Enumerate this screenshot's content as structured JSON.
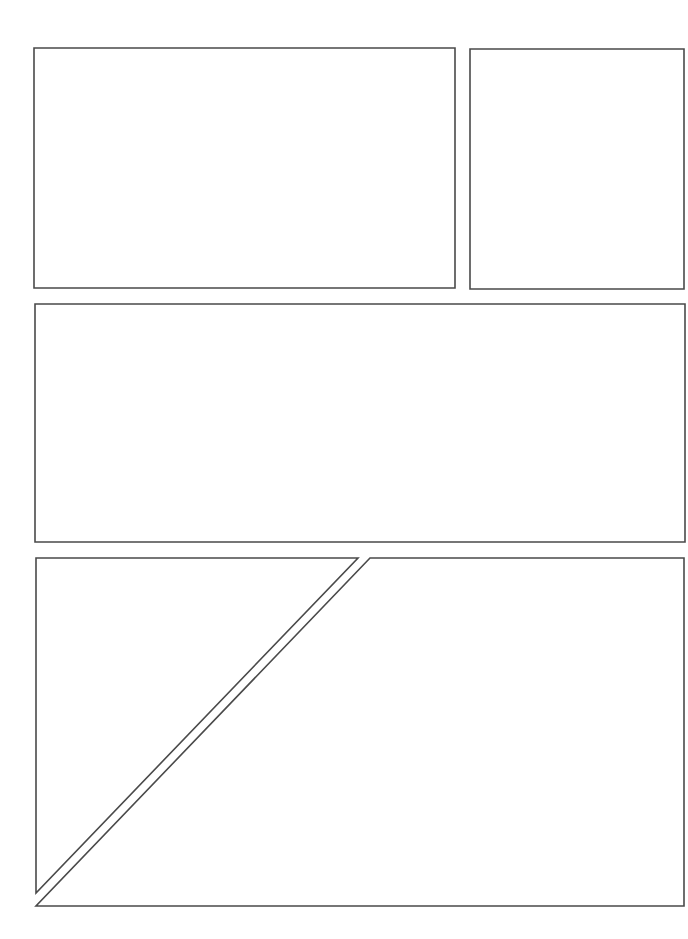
{
  "page": {
    "type": "comic-panel-layout-template",
    "panel_count": 5,
    "border_color": "#4a4a4a",
    "background_color": "#ffffff"
  },
  "panels": [
    {
      "id": "panel-1",
      "shape": "rect",
      "points": "34,48 455,48 455,288 34,288"
    },
    {
      "id": "panel-2",
      "shape": "rect",
      "points": "470,49 684,49 684,289 470,289"
    },
    {
      "id": "panel-3",
      "shape": "rect",
      "points": "35,304 685,304 685,542 35,542"
    },
    {
      "id": "panel-4",
      "shape": "triangle",
      "points": "36,558 358,558 36,893"
    },
    {
      "id": "panel-5",
      "shape": "polygon",
      "points": "370,558 684,558 684,906 36,906"
    }
  ]
}
